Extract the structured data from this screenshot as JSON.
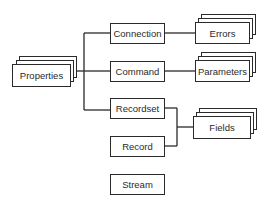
{
  "diagram": {
    "type": "object-model hierarchy",
    "line_color": "#2a2a2a",
    "nodes": [
      {
        "id": "properties",
        "label": "Properties",
        "collection": true
      },
      {
        "id": "connection",
        "label": "Connection",
        "collection": false
      },
      {
        "id": "command",
        "label": "Command",
        "collection": false
      },
      {
        "id": "recordset",
        "label": "Recordset",
        "collection": false
      },
      {
        "id": "record",
        "label": "Record",
        "collection": false
      },
      {
        "id": "stream",
        "label": "Stream",
        "collection": false
      },
      {
        "id": "errors",
        "label": "Errors",
        "collection": true
      },
      {
        "id": "parameters",
        "label": "Parameters",
        "collection": true
      },
      {
        "id": "fields",
        "label": "Fields",
        "collection": true
      }
    ],
    "edges": [
      {
        "from": "properties",
        "to": "connection"
      },
      {
        "from": "properties",
        "to": "command"
      },
      {
        "from": "properties",
        "to": "recordset"
      },
      {
        "from": "connection",
        "to": "errors"
      },
      {
        "from": "command",
        "to": "parameters"
      },
      {
        "from": "recordset",
        "to": "fields"
      },
      {
        "from": "record",
        "to": "fields"
      }
    ]
  }
}
